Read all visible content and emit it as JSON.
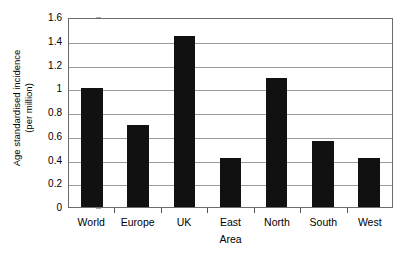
{
  "chart_data": {
    "type": "bar",
    "title": "",
    "xlabel": "Area",
    "ylabel": "Age standardised incidence (per million)",
    "ylabel_line1": "Age standardised incidence",
    "ylabel_line2": "(per million)",
    "categories": [
      "World",
      "Europe",
      "UK",
      "East",
      "North",
      "South",
      "West"
    ],
    "values": [
      1.0,
      0.69,
      1.44,
      0.41,
      1.09,
      0.56,
      0.41
    ],
    "ylim": [
      0,
      1.6
    ],
    "ytick_labels": [
      "1.6",
      "1.4",
      "1.2",
      "1",
      "0.8",
      "0.6",
      "0.4",
      "0.2",
      "0"
    ],
    "ytick_values": [
      1.6,
      1.4,
      1.2,
      1.0,
      0.8,
      0.6,
      0.4,
      0.2,
      0
    ],
    "grid": "horizontal",
    "legend": "none",
    "bar_color": "#111111",
    "grid_color": "#9a9a9a",
    "axis_color": "#6c6c6c",
    "background": "#ffffff"
  }
}
